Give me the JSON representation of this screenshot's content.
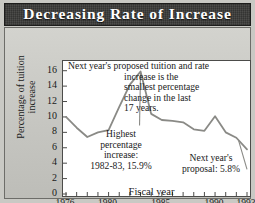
{
  "header": {
    "title": "Decreasing Rate of Increase"
  },
  "annotations": {
    "top_line1": "Next year's proposed tuition and rate",
    "top_line2": "increase is the",
    "top_line3": "smallest percentage",
    "top_line4": "change in the last",
    "top_line5": "17 years.",
    "highest_l1": "Highest",
    "highest_l2": "percentage",
    "highest_l3": "increase:",
    "highest_l4": "1982-83, 15.9%",
    "proposal_l1": "Next year's",
    "proposal_l2": "proposal: 5.8%"
  },
  "colors": {
    "title_bar": "#3a3a38",
    "title_text": "#ffffff",
    "plate": "#c9c9c4",
    "plot_bg": "#ffffff",
    "line": "#8a8a86",
    "axis": "#4c4c4a"
  },
  "chart_data": {
    "type": "line",
    "title": "Decreasing Rate of Increase",
    "xlabel": "Fiscal year",
    "ylabel": "Percentage of tuition increase",
    "xlim": [
      1976,
      1993
    ],
    "ylim": [
      0,
      17
    ],
    "yticks": [
      0,
      2,
      4,
      6,
      8,
      10,
      12,
      14,
      16
    ],
    "xticks_labeled": [
      1976,
      1980,
      1985,
      1990,
      1993
    ],
    "xticks_all": [
      1976,
      1977,
      1978,
      1979,
      1980,
      1981,
      1982,
      1983,
      1984,
      1985,
      1986,
      1987,
      1988,
      1989,
      1990,
      1991,
      1992,
      1993
    ],
    "grid": false,
    "legend": "none",
    "x": [
      1976,
      1977,
      1978,
      1979,
      1980,
      1981,
      1982,
      1983,
      1984,
      1985,
      1986,
      1987,
      1988,
      1989,
      1990,
      1991,
      1992,
      1993
    ],
    "values": [
      10.0,
      8.6,
      7.4,
      8.0,
      8.3,
      11.3,
      14.2,
      15.9,
      10.4,
      9.6,
      9.5,
      9.3,
      8.4,
      8.2,
      10.1,
      8.0,
      7.3,
      5.8
    ],
    "annotations": [
      {
        "label": "Highest percentage increase: 1982-83, 15.9%",
        "x": 1983,
        "y": 15.9
      },
      {
        "label": "Next year's proposal: 5.8%",
        "x": 1993,
        "y": 5.8
      },
      {
        "label": "Next year's proposed tuition and rate increase is the smallest percentage change in the last 17 years."
      }
    ]
  }
}
